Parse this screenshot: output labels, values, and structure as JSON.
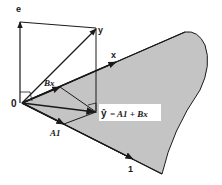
{
  "diagram": {
    "type": "vector-projection",
    "colors": {
      "plane_fill": "#c4c4c4",
      "stroke": "#1a1a1a",
      "background": "#ffffff"
    },
    "labels": {
      "origin": "0",
      "e": "e",
      "y": "y",
      "x": "x",
      "bx": "Bx",
      "a1": "A1",
      "one": "1",
      "yhat_lhs": "ŷ",
      "yhat_eq": "= A1 + Bx"
    },
    "vectors": [
      {
        "name": "e",
        "from": "origin",
        "to": "e-tip"
      },
      {
        "name": "y",
        "from": "origin",
        "to": "y-tip"
      },
      {
        "name": "x",
        "on": "plane-top-edge"
      },
      {
        "name": "Bx",
        "from": "origin"
      },
      {
        "name": "A1",
        "from": "origin"
      },
      {
        "name": "1",
        "on": "plane-bottom-edge"
      },
      {
        "name": "y-hat",
        "from": "origin",
        "to": "projection-point"
      }
    ]
  }
}
